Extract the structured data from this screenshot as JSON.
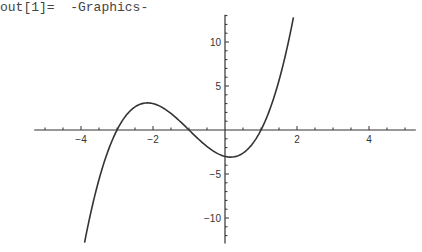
{
  "output_label": "out[1]=  -Graphics-",
  "chart_data": {
    "type": "line",
    "title": "",
    "xlabel": "",
    "ylabel": "",
    "function": "x^3 + 3x^2 - x - 3 = (x+3)(x+1)(x-1)",
    "xlim": [
      -5.3,
      5.3
    ],
    "ylim": [
      -12.9,
      13.1
    ],
    "grid": false,
    "legend": null,
    "x_ticks": [
      -4,
      -2,
      2,
      4
    ],
    "x_tick_labels": [
      "-4",
      "-2",
      "2",
      "4"
    ],
    "y_ticks": [
      -10,
      -5,
      5,
      10
    ],
    "y_tick_labels": [
      "-10",
      "-5",
      "5",
      "10"
    ],
    "x_minor_step": 0.5,
    "y_minor_step": 1,
    "series": [
      {
        "name": "f(x)",
        "x": [
          -3.9,
          -3.5,
          -3.0,
          -2.5,
          -2.155,
          -2.0,
          -1.5,
          -1.0,
          -0.5,
          0.0,
          0.155,
          0.5,
          1.0,
          1.5,
          1.9
        ],
        "y": [
          -12.79,
          -5.63,
          0.0,
          2.63,
          3.08,
          3.0,
          1.88,
          0.0,
          -1.88,
          -3.0,
          -3.08,
          -2.63,
          0.0,
          5.63,
          12.79
        ]
      }
    ],
    "roots": [
      -3,
      -1,
      1
    ],
    "local_max": [
      -2.155,
      3.08
    ],
    "local_min": [
      0.155,
      -3.08
    ],
    "colors": {
      "curve": "#333333",
      "axes": "#333333",
      "background": "#ffffff"
    }
  }
}
